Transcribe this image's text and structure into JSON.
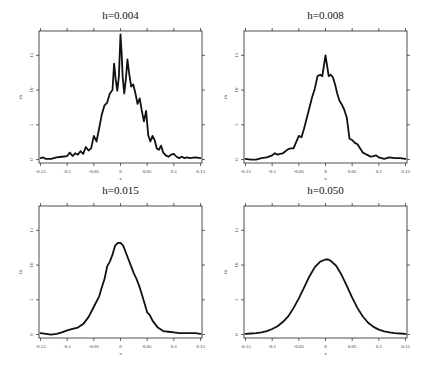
{
  "figure": {
    "panels_layout": "2x2",
    "shared_xlabel": "x",
    "shared_ylabel": "fh"
  },
  "chart_data": [
    {
      "type": "line",
      "title": "h=0.004",
      "xlabel": "x",
      "ylabel": "fh",
      "xlim": [
        -0.15,
        0.15
      ],
      "ylim": [
        -0.5,
        18.5
      ],
      "xticks": [
        "-0.15",
        "-0.1",
        "-0.05",
        "0",
        "0.05",
        "0.1",
        "0.15"
      ],
      "yticks": [
        "0",
        "5",
        "10",
        "15"
      ],
      "grid": false,
      "x": [
        -0.15,
        -0.145,
        -0.14,
        -0.13,
        -0.12,
        -0.11,
        -0.1,
        -0.095,
        -0.09,
        -0.085,
        -0.08,
        -0.075,
        -0.07,
        -0.065,
        -0.06,
        -0.055,
        -0.05,
        -0.045,
        -0.04,
        -0.035,
        -0.03,
        -0.025,
        -0.02,
        -0.015,
        -0.012,
        -0.009,
        -0.006,
        -0.003,
        0,
        0.002,
        0.004,
        0.007,
        0.01,
        0.013,
        0.016,
        0.02,
        0.024,
        0.028,
        0.032,
        0.036,
        0.04,
        0.044,
        0.048,
        0.052,
        0.056,
        0.06,
        0.064,
        0.068,
        0.072,
        0.076,
        0.08,
        0.085,
        0.09,
        0.095,
        0.1,
        0.105,
        0.11,
        0.115,
        0.12,
        0.125,
        0.13,
        0.14,
        0.15
      ],
      "values": [
        0.2,
        0.3,
        0.1,
        0.1,
        0.3,
        0.4,
        0.5,
        1.0,
        0.5,
        0.9,
        0.7,
        1.2,
        0.8,
        1.8,
        1.3,
        1.6,
        3.4,
        2.6,
        4.5,
        6.5,
        7.8,
        8.2,
        9.5,
        10.0,
        13.8,
        11.5,
        9.9,
        12.0,
        18.0,
        15.5,
        12.0,
        9.5,
        11.5,
        14.4,
        12.5,
        10.5,
        10.8,
        9.5,
        8.0,
        8.8,
        7.0,
        5.5,
        7.0,
        3.5,
        2.6,
        3.4,
        2.8,
        1.6,
        1.4,
        2.0,
        1.0,
        0.6,
        0.4,
        0.7,
        0.8,
        0.4,
        0.2,
        0.4,
        0.2,
        0.3,
        0.2,
        0.3,
        0.2
      ]
    },
    {
      "type": "line",
      "title": "h=0.008",
      "xlabel": "x",
      "ylabel": "fh",
      "xlim": [
        -0.15,
        0.15
      ],
      "ylim": [
        -0.5,
        18.5
      ],
      "xticks": [
        "-0.15",
        "-0.1",
        "-0.05",
        "0",
        "0.05",
        "0.1",
        "0.15"
      ],
      "yticks": [
        "0",
        "5",
        "10",
        "15"
      ],
      "grid": false,
      "x": [
        -0.15,
        -0.14,
        -0.13,
        -0.12,
        -0.11,
        -0.1,
        -0.095,
        -0.09,
        -0.085,
        -0.08,
        -0.075,
        -0.07,
        -0.065,
        -0.06,
        -0.055,
        -0.05,
        -0.045,
        -0.04,
        -0.035,
        -0.03,
        -0.025,
        -0.02,
        -0.015,
        -0.01,
        -0.006,
        -0.003,
        0,
        0.003,
        0.006,
        0.01,
        0.014,
        0.018,
        0.022,
        0.026,
        0.03,
        0.035,
        0.04,
        0.045,
        0.05,
        0.055,
        0.06,
        0.065,
        0.07,
        0.075,
        0.08,
        0.085,
        0.09,
        0.095,
        0.1,
        0.105,
        0.11,
        0.12,
        0.13,
        0.14,
        0.15
      ],
      "values": [
        0.1,
        0.0,
        0.0,
        0.2,
        0.3,
        0.6,
        0.9,
        0.7,
        0.8,
        0.9,
        1.2,
        1.5,
        1.6,
        1.6,
        2.5,
        3.4,
        3.2,
        4.5,
        6.0,
        7.5,
        9.0,
        10.2,
        12.0,
        12.2,
        12.0,
        13.5,
        15.0,
        13.5,
        12.0,
        12.2,
        11.8,
        10.8,
        9.5,
        8.5,
        8.0,
        7.2,
        6.0,
        3.0,
        2.8,
        2.4,
        2.2,
        1.6,
        1.0,
        0.8,
        0.6,
        0.4,
        0.5,
        0.6,
        0.3,
        0.2,
        0.1,
        0.3,
        0.2,
        0.2,
        0.1
      ]
    },
    {
      "type": "line",
      "title": "h=0.015",
      "xlabel": "x",
      "ylabel": "fh",
      "xlim": [
        -0.15,
        0.15
      ],
      "ylim": [
        -0.5,
        18.5
      ],
      "xticks": [
        "-0.15",
        "-0.1",
        "-0.05",
        "0",
        "0.05",
        "0.1",
        "0.15"
      ],
      "yticks": [
        "0",
        "5",
        "10",
        "15"
      ],
      "grid": false,
      "x": [
        -0.15,
        -0.14,
        -0.13,
        -0.12,
        -0.11,
        -0.1,
        -0.09,
        -0.08,
        -0.07,
        -0.06,
        -0.05,
        -0.04,
        -0.035,
        -0.03,
        -0.025,
        -0.02,
        -0.015,
        -0.01,
        -0.005,
        0,
        0.005,
        0.01,
        0.015,
        0.02,
        0.025,
        0.03,
        0.035,
        0.04,
        0.045,
        0.05,
        0.055,
        0.06,
        0.07,
        0.08,
        0.09,
        0.1,
        0.11,
        0.12,
        0.13,
        0.14,
        0.15
      ],
      "values": [
        0.2,
        0.1,
        0.0,
        0.1,
        0.3,
        0.6,
        0.8,
        1.0,
        1.5,
        2.5,
        4.0,
        5.5,
        6.8,
        8.0,
        9.8,
        10.5,
        11.5,
        12.8,
        13.2,
        13.2,
        12.8,
        11.8,
        10.8,
        9.8,
        8.8,
        8.0,
        7.0,
        5.8,
        4.5,
        3.2,
        2.8,
        2.0,
        1.0,
        0.5,
        0.4,
        0.3,
        0.2,
        0.2,
        0.2,
        0.2,
        0.1
      ]
    },
    {
      "type": "line",
      "title": "h=0.050",
      "xlabel": "x",
      "ylabel": "fh",
      "xlim": [
        -0.15,
        0.15
      ],
      "ylim": [
        -0.5,
        18.5
      ],
      "xticks": [
        "-0.15",
        "-0.1",
        "-0.05",
        "0",
        "0.05",
        "0.1",
        "0.15"
      ],
      "yticks": [
        "0",
        "5",
        "10",
        "15"
      ],
      "grid": false,
      "x": [
        -0.15,
        -0.14,
        -0.13,
        -0.12,
        -0.11,
        -0.1,
        -0.09,
        -0.08,
        -0.07,
        -0.06,
        -0.05,
        -0.04,
        -0.03,
        -0.02,
        -0.01,
        0,
        0.005,
        0.01,
        0.02,
        0.03,
        0.04,
        0.05,
        0.06,
        0.07,
        0.08,
        0.09,
        0.1,
        0.11,
        0.12,
        0.13,
        0.14,
        0.15
      ],
      "values": [
        0.1,
        0.15,
        0.2,
        0.3,
        0.5,
        0.8,
        1.2,
        1.8,
        2.6,
        3.8,
        5.2,
        6.8,
        8.4,
        9.7,
        10.5,
        10.8,
        10.8,
        10.6,
        9.9,
        8.6,
        7.0,
        5.3,
        3.8,
        2.6,
        1.7,
        1.1,
        0.7,
        0.45,
        0.3,
        0.2,
        0.15,
        0.1
      ]
    }
  ]
}
